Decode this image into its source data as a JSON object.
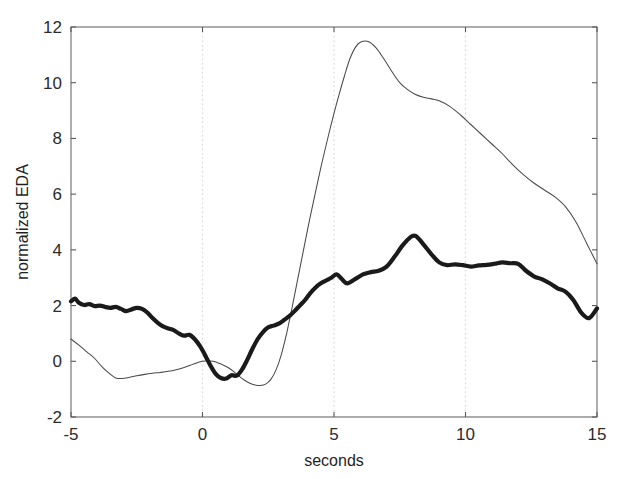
{
  "chart_data": {
    "type": "line",
    "title": "",
    "xlabel": "seconds",
    "ylabel": "normalized EDA",
    "xlim": [
      -5,
      15
    ],
    "ylim": [
      -2,
      12
    ],
    "xticks": [
      -5,
      0,
      5,
      10,
      15
    ],
    "xtick_labels": [
      "-5",
      "0",
      "5",
      "10",
      "15"
    ],
    "yticks": [
      -2,
      0,
      2,
      4,
      6,
      8,
      10,
      12
    ],
    "ytick_labels": [
      "-2",
      "0",
      "2",
      "4",
      "6",
      "8",
      "10",
      "12"
    ],
    "grid": "vertical dotted gridlines at x = 0, 5, 10",
    "gridlines_x": [
      0,
      5,
      10
    ],
    "legend": "none",
    "background_color": "#ffffff",
    "axis_color": "#6b6b6b",
    "series": [
      {
        "name": "thin-trace",
        "style": "thin solid line",
        "color": "#4a4a4a",
        "line_width": 1,
        "x": [
          -5.0,
          -4.7,
          -4.4,
          -4.1,
          -3.8,
          -3.5,
          -3.3,
          -3.1,
          -2.8,
          -2.5,
          -2.2,
          -1.9,
          -1.6,
          -1.3,
          -1.0,
          -0.7,
          -0.4,
          -0.2,
          0.0,
          0.2,
          0.4,
          0.6,
          0.8,
          1.0,
          1.2,
          1.4,
          1.6,
          1.8,
          2.0,
          2.2,
          2.4,
          2.6,
          2.8,
          3.0,
          3.2,
          3.4,
          3.6,
          3.8,
          4.0,
          4.2,
          4.5,
          4.8,
          5.0,
          5.2,
          5.4,
          5.6,
          5.8,
          6.0,
          6.3,
          6.6,
          6.9,
          7.2,
          7.5,
          7.8,
          8.1,
          8.4,
          8.7,
          9.0,
          9.4,
          9.8,
          10.2,
          10.6,
          11.0,
          11.4,
          11.8,
          12.2,
          12.6,
          13.0,
          13.4,
          13.8,
          14.2,
          14.6,
          15.0
        ],
        "y": [
          0.8,
          0.58,
          0.34,
          0.1,
          -0.22,
          -0.47,
          -0.6,
          -0.62,
          -0.58,
          -0.52,
          -0.47,
          -0.43,
          -0.4,
          -0.36,
          -0.3,
          -0.22,
          -0.12,
          -0.05,
          0.0,
          0.02,
          0.0,
          -0.06,
          -0.14,
          -0.24,
          -0.38,
          -0.54,
          -0.68,
          -0.79,
          -0.85,
          -0.87,
          -0.82,
          -0.65,
          -0.3,
          0.25,
          1.0,
          1.9,
          2.85,
          3.8,
          4.75,
          5.65,
          6.95,
          8.15,
          8.9,
          9.6,
          10.25,
          10.85,
          11.25,
          11.45,
          11.48,
          11.25,
          10.85,
          10.4,
          10.0,
          9.75,
          9.58,
          9.48,
          9.42,
          9.35,
          9.15,
          8.85,
          8.5,
          8.15,
          7.8,
          7.45,
          7.05,
          6.7,
          6.4,
          6.15,
          5.9,
          5.55,
          5.0,
          4.25,
          3.5
        ]
      },
      {
        "name": "thick-trace",
        "style": "thick solid line",
        "color": "#1a1a1a",
        "line_width": 4,
        "x": [
          -5.0,
          -4.85,
          -4.7,
          -4.5,
          -4.3,
          -4.1,
          -3.9,
          -3.7,
          -3.5,
          -3.3,
          -3.1,
          -2.9,
          -2.7,
          -2.5,
          -2.3,
          -2.1,
          -1.9,
          -1.7,
          -1.5,
          -1.3,
          -1.1,
          -0.9,
          -0.7,
          -0.5,
          -0.3,
          -0.1,
          0.1,
          0.3,
          0.5,
          0.7,
          0.9,
          1.1,
          1.3,
          1.5,
          1.7,
          1.9,
          2.1,
          2.3,
          2.5,
          2.7,
          2.9,
          3.1,
          3.3,
          3.5,
          3.7,
          3.9,
          4.1,
          4.3,
          4.5,
          4.7,
          4.9,
          5.1,
          5.3,
          5.5,
          5.8,
          6.1,
          6.4,
          6.7,
          7.0,
          7.3,
          7.6,
          7.9,
          8.1,
          8.4,
          8.7,
          9.0,
          9.3,
          9.6,
          9.9,
          10.2,
          10.5,
          10.8,
          11.1,
          11.4,
          11.7,
          12.0,
          12.3,
          12.6,
          12.9,
          13.2,
          13.5,
          13.8,
          14.1,
          14.4,
          14.7,
          15.0
        ],
        "y": [
          2.15,
          2.25,
          2.1,
          2.02,
          2.05,
          1.98,
          2.0,
          1.95,
          1.92,
          1.95,
          1.88,
          1.8,
          1.86,
          1.92,
          1.88,
          1.75,
          1.55,
          1.38,
          1.25,
          1.18,
          1.12,
          1.0,
          0.92,
          0.95,
          0.8,
          0.55,
          0.22,
          -0.15,
          -0.45,
          -0.6,
          -0.62,
          -0.5,
          -0.52,
          -0.3,
          0.05,
          0.45,
          0.8,
          1.05,
          1.22,
          1.28,
          1.35,
          1.48,
          1.62,
          1.8,
          2.0,
          2.2,
          2.45,
          2.65,
          2.8,
          2.9,
          3.0,
          3.12,
          2.95,
          2.8,
          2.95,
          3.12,
          3.2,
          3.25,
          3.4,
          3.75,
          4.15,
          4.45,
          4.5,
          4.2,
          3.85,
          3.55,
          3.45,
          3.48,
          3.45,
          3.4,
          3.44,
          3.46,
          3.5,
          3.55,
          3.52,
          3.5,
          3.25,
          3.05,
          2.95,
          2.8,
          2.62,
          2.5,
          2.2,
          1.75,
          1.55,
          1.9
        ]
      }
    ]
  },
  "axes": {
    "ylabel_text": "normalized EDA",
    "xlabel_text": "seconds"
  }
}
